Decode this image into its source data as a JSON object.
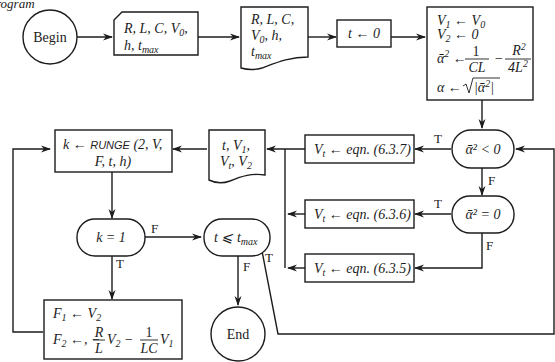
{
  "header": {
    "partial_title": "rogram"
  },
  "nodes": {
    "begin": {
      "type": "terminal",
      "label": "Begin"
    },
    "input_card": {
      "type": "input",
      "line1": "R, L, C, V",
      "line1_sub": "0",
      "line1_end": ",",
      "line2": "h, t",
      "line2_sub": "max"
    },
    "print_params": {
      "type": "document",
      "line1": "R, L, C,",
      "line2": "V",
      "line2_sub": "0",
      "line2_end": ", h,",
      "line3": "t",
      "line3_sub": "max"
    },
    "init_t": {
      "type": "process",
      "label": "t ← 0"
    },
    "init_block": {
      "type": "process",
      "lines": [
        "V₁ ← V₀",
        "V₂ ← 0",
        "ᾱ² ← 1/(CL) − R²/(4L²)",
        "α ← √|ᾱ²|"
      ]
    },
    "decision_lt": {
      "type": "decision",
      "label": "ᾱ² < 0"
    },
    "decision_eq": {
      "type": "decision",
      "label": "ᾱ² = 0"
    },
    "eqn_637": {
      "type": "process",
      "label": "V",
      "sub": "t",
      "rest": " ← eqn. (6.3.7)"
    },
    "eqn_636": {
      "type": "process",
      "label": "V",
      "sub": "t",
      "rest": " ← eqn. (6.3.6)"
    },
    "eqn_635": {
      "type": "process",
      "label": "V",
      "sub": "t",
      "rest": " ← eqn. (6.3.5)"
    },
    "print_state": {
      "type": "document",
      "line1": "t, V",
      "line1_sub": "1",
      "line1_end": ",",
      "line2": "V",
      "line2_sub": "t",
      "line2_mid": ", V",
      "line2_sub2": "2"
    },
    "runge": {
      "type": "process",
      "line1_k": "k",
      "line1_arrow": " ← ",
      "line1_fn": "RUNGE",
      "line1_args": " (2, V,",
      "line2": "F, t, h)"
    },
    "decision_k": {
      "type": "decision",
      "label": "k = 1"
    },
    "decision_t": {
      "type": "decision",
      "label": "t ⩽ t",
      "sub": "max"
    },
    "derivs": {
      "type": "process",
      "line1": "F₁ ← V₂",
      "line2": "F₂ ← − (R/L) V₂ − (1/LC) V₁"
    },
    "end": {
      "type": "terminal",
      "label": "End"
    }
  },
  "edge_labels": {
    "lt_true": "T",
    "lt_false": "F",
    "eq_true": "T",
    "eq_false": "F",
    "k_false": "F",
    "k_true": "T",
    "t_false": "F",
    "t_true": "T"
  }
}
